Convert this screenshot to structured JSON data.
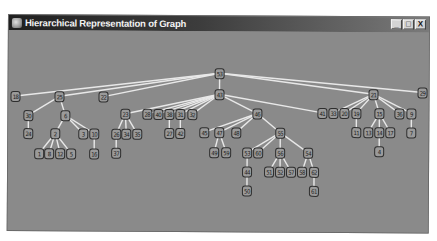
{
  "window": {
    "title": "Hierarchical Representation of Graph",
    "controls": {
      "minimize": "_",
      "maximize": "□",
      "close": "X"
    }
  },
  "graph": {
    "edge_color": "#e8e8e8",
    "node_color": "#9a9a9a",
    "background": "#8a8a8a",
    "nodes": [
      {
        "id": "53",
        "x": 220,
        "y": 72
      },
      {
        "id": "43",
        "x": 220,
        "y": 93
      },
      {
        "id": "18",
        "x": 16,
        "y": 96
      },
      {
        "id": "25",
        "x": 60,
        "y": 96
      },
      {
        "id": "22",
        "x": 104,
        "y": 96
      },
      {
        "id": "21",
        "x": 374,
        "y": 92
      },
      {
        "id": "29",
        "x": 423,
        "y": 90
      },
      {
        "id": "30",
        "x": 29,
        "y": 115
      },
      {
        "id": "6",
        "x": 66,
        "y": 115
      },
      {
        "id": "24",
        "x": 29,
        "y": 133
      },
      {
        "id": "2",
        "x": 56,
        "y": 133
      },
      {
        "id": "3",
        "x": 84,
        "y": 133
      },
      {
        "id": "10",
        "x": 95,
        "y": 133
      },
      {
        "id": "1",
        "x": 40,
        "y": 153
      },
      {
        "id": "8",
        "x": 50,
        "y": 153
      },
      {
        "id": "12",
        "x": 61,
        "y": 153
      },
      {
        "id": "5",
        "x": 72,
        "y": 153
      },
      {
        "id": "16",
        "x": 95,
        "y": 153
      },
      {
        "id": "23",
        "x": 126,
        "y": 113
      },
      {
        "id": "26",
        "x": 117,
        "y": 133
      },
      {
        "id": "34",
        "x": 127,
        "y": 133
      },
      {
        "id": "35",
        "x": 138,
        "y": 133
      },
      {
        "id": "37",
        "x": 117,
        "y": 152
      },
      {
        "id": "28",
        "x": 148,
        "y": 113
      },
      {
        "id": "40",
        "x": 159,
        "y": 113
      },
      {
        "id": "38",
        "x": 170,
        "y": 113
      },
      {
        "id": "31",
        "x": 181,
        "y": 113
      },
      {
        "id": "32",
        "x": 193,
        "y": 113
      },
      {
        "id": "27",
        "x": 170,
        "y": 132
      },
      {
        "id": "42",
        "x": 181,
        "y": 132
      },
      {
        "id": "46",
        "x": 258,
        "y": 112
      },
      {
        "id": "45",
        "x": 205,
        "y": 131
      },
      {
        "id": "47",
        "x": 220,
        "y": 131
      },
      {
        "id": "48",
        "x": 237,
        "y": 131
      },
      {
        "id": "49",
        "x": 215,
        "y": 151
      },
      {
        "id": "59",
        "x": 227,
        "y": 151
      },
      {
        "id": "55",
        "x": 281,
        "y": 131
      },
      {
        "id": "53b",
        "label": "53",
        "x": 248,
        "y": 151
      },
      {
        "id": "60",
        "x": 259,
        "y": 151
      },
      {
        "id": "56",
        "x": 281,
        "y": 151
      },
      {
        "id": "54",
        "x": 309,
        "y": 151
      },
      {
        "id": "44",
        "x": 248,
        "y": 170
      },
      {
        "id": "50",
        "x": 248,
        "y": 189
      },
      {
        "id": "51",
        "x": 270,
        "y": 170
      },
      {
        "id": "52",
        "x": 281,
        "y": 170
      },
      {
        "id": "57",
        "x": 292,
        "y": 170
      },
      {
        "id": "58",
        "x": 303,
        "y": 170
      },
      {
        "id": "62",
        "x": 315,
        "y": 170
      },
      {
        "id": "61",
        "x": 315,
        "y": 189
      },
      {
        "id": "41",
        "x": 323,
        "y": 111
      },
      {
        "id": "33",
        "x": 334,
        "y": 111
      },
      {
        "id": "20",
        "x": 345,
        "y": 111
      },
      {
        "id": "19",
        "x": 357,
        "y": 111
      },
      {
        "id": "15",
        "x": 380,
        "y": 111
      },
      {
        "id": "36",
        "x": 400,
        "y": 111
      },
      {
        "id": "9",
        "x": 412,
        "y": 111
      },
      {
        "id": "11",
        "x": 357,
        "y": 130
      },
      {
        "id": "13",
        "x": 369,
        "y": 130
      },
      {
        "id": "14",
        "x": 380,
        "y": 130
      },
      {
        "id": "17",
        "x": 391,
        "y": 130
      },
      {
        "id": "7",
        "x": 412,
        "y": 130
      },
      {
        "id": "4",
        "x": 380,
        "y": 149
      }
    ],
    "edges": [
      [
        "53",
        "43"
      ],
      [
        "53",
        "18"
      ],
      [
        "53",
        "25"
      ],
      [
        "53",
        "22"
      ],
      [
        "53",
        "21"
      ],
      [
        "53",
        "29"
      ],
      [
        "25",
        "30"
      ],
      [
        "25",
        "6"
      ],
      [
        "30",
        "24"
      ],
      [
        "6",
        "2"
      ],
      [
        "6",
        "3"
      ],
      [
        "6",
        "10"
      ],
      [
        "2",
        "1"
      ],
      [
        "2",
        "8"
      ],
      [
        "2",
        "12"
      ],
      [
        "2",
        "5"
      ],
      [
        "10",
        "16"
      ],
      [
        "43",
        "23"
      ],
      [
        "43",
        "28"
      ],
      [
        "43",
        "40"
      ],
      [
        "43",
        "38"
      ],
      [
        "43",
        "31"
      ],
      [
        "43",
        "32"
      ],
      [
        "43",
        "46"
      ],
      [
        "43",
        "41"
      ],
      [
        "23",
        "26"
      ],
      [
        "23",
        "34"
      ],
      [
        "23",
        "35"
      ],
      [
        "26",
        "37"
      ],
      [
        "38",
        "27"
      ],
      [
        "31",
        "42"
      ],
      [
        "46",
        "45"
      ],
      [
        "46",
        "47"
      ],
      [
        "46",
        "48"
      ],
      [
        "46",
        "55"
      ],
      [
        "47",
        "49"
      ],
      [
        "47",
        "59"
      ],
      [
        "55",
        "53b"
      ],
      [
        "55",
        "60"
      ],
      [
        "55",
        "56"
      ],
      [
        "55",
        "54"
      ],
      [
        "53b",
        "44"
      ],
      [
        "44",
        "50"
      ],
      [
        "56",
        "51"
      ],
      [
        "56",
        "52"
      ],
      [
        "56",
        "57"
      ],
      [
        "54",
        "58"
      ],
      [
        "54",
        "62"
      ],
      [
        "62",
        "61"
      ],
      [
        "21",
        "33"
      ],
      [
        "21",
        "20"
      ],
      [
        "21",
        "19"
      ],
      [
        "21",
        "15"
      ],
      [
        "21",
        "36"
      ],
      [
        "21",
        "9"
      ],
      [
        "19",
        "11"
      ],
      [
        "15",
        "13"
      ],
      [
        "15",
        "14"
      ],
      [
        "15",
        "17"
      ],
      [
        "14",
        "4"
      ],
      [
        "9",
        "7"
      ]
    ]
  }
}
